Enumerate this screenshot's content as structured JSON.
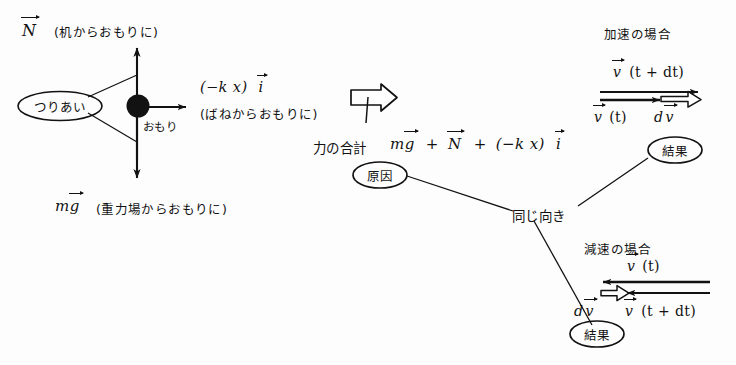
{
  "diagram": {
    "title_text": "力と運動の関係図",
    "type": "handwritten-physics-diagram",
    "ink_color": "#121212",
    "paper_color": "#fdfdfd"
  },
  "free_body": {
    "normal_force_label": "N",
    "normal_force_note": "(机からおもりに)",
    "spring_force_label": "(−k x)",
    "spring_force_unit": "i",
    "spring_force_note": "(ばねからおもりに)",
    "gravity_label": "m g",
    "gravity_symbol_m": "m",
    "gravity_symbol_g": "g",
    "gravity_note": "(重力場からおもりに)",
    "mass_label": "おもり",
    "balance_label": "つりあい"
  },
  "force_sum": {
    "prefix": "力の合計",
    "term1_m": "m",
    "term1_g": "g",
    "plus1": "+",
    "term2": "N",
    "plus2": "+",
    "term3": "(−k x)",
    "term3_unit": "i",
    "cause_badge": "原因"
  },
  "relation": {
    "same_direction_label": "同じ向き"
  },
  "accel_case": {
    "heading": "加速の場合",
    "v_t_dt_label": "v",
    "v_t_dt_arg": "(t + dt)",
    "v_t_label": "v",
    "v_t_arg": "(t)",
    "dv_label_d": "d",
    "dv_label_v": "v",
    "result_badge": "結果"
  },
  "decel_case": {
    "heading": "減速の場合",
    "v_t_label": "v",
    "v_t_arg": "(t)",
    "dv_label_d": "d",
    "dv_label_v": "v",
    "v_t_dt_label": "v",
    "v_t_dt_arg": "(t + dt)",
    "result_badge": "結果"
  }
}
